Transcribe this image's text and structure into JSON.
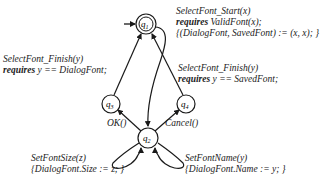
{
  "diagram": {
    "states": [
      {
        "id": "q1",
        "label": "q1",
        "initial": true,
        "accepting": true
      },
      {
        "id": "q2",
        "label": "q2",
        "initial": false,
        "accepting": false
      },
      {
        "id": "q3",
        "label": "q3",
        "initial": false,
        "accepting": false
      },
      {
        "id": "q4",
        "label": "q4",
        "initial": false,
        "accepting": false
      }
    ],
    "transitions": {
      "q1_q2": {
        "line1": "SelectFont_Start(x)",
        "kw": "requires",
        "line2_rest": " ValidFont(x);",
        "line3": "{(DialogFont, SavedFont) := (x, x); }"
      },
      "q3_q1": {
        "line1": "SelectFont_Finish(y)",
        "kw": "requires",
        "line2_rest": " y == DialogFont;"
      },
      "q4_q1": {
        "line1": "SelectFont_Finish(y)",
        "kw": "requires",
        "line2_rest": " y == SavedFont;"
      },
      "q2_q3": {
        "line1": "OK()"
      },
      "q2_q4": {
        "line1": "Cancel()"
      },
      "q2_q2_left": {
        "line1": "SetFontSize(z)",
        "line2": "{DialogFont.Size := z; }"
      },
      "q2_q2_right": {
        "line1": "SetFontName(y)",
        "line2": "{DialogFont.Name := y; }"
      }
    },
    "colors": {
      "stroke": "#1a1a1a",
      "background": "#ffffff"
    }
  }
}
